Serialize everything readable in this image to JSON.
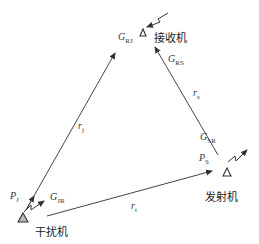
{
  "diagram": {
    "nodes": {
      "receiver": {
        "label": "接收机",
        "gain_rj": "G",
        "gain_rj_sub": "RJ",
        "gain_rs": "G",
        "gain_rs_sub": "RS"
      },
      "jammer": {
        "label": "干扰机",
        "power": "P",
        "power_sub": "J",
        "gain": "G",
        "gain_sub": "JR"
      },
      "transmitter": {
        "label": "发射机",
        "power": "P",
        "power_sub": "S",
        "gain": "G",
        "gain_sub": "SR"
      }
    },
    "edges": {
      "jammer_to_receiver": {
        "label": "r",
        "label_sub": "j"
      },
      "transmitter_to_receiver": {
        "label": "r",
        "label_sub": "s"
      },
      "jammer_to_transmitter": {
        "label": "r",
        "label_sub": "t"
      }
    },
    "colors": {
      "line": "#333333",
      "text": "#333333"
    }
  }
}
